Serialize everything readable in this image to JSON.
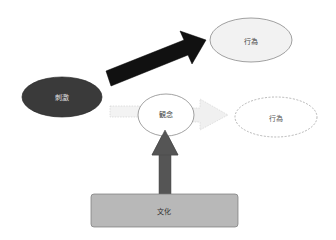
{
  "diagram": {
    "nodes": {
      "stimulus": {
        "label": "刺激",
        "fill": "#3a3a3a",
        "text_color": "#e6e6e6"
      },
      "action_top": {
        "label": "行為",
        "fill": "#f2f2f2",
        "text_color": "#444444"
      },
      "idea": {
        "label": "観念",
        "fill": "#ffffff",
        "text_color": "#444444"
      },
      "action_dashed": {
        "label": "行為",
        "fill": "#ffffff",
        "text_color": "#555555"
      },
      "culture": {
        "label": "文化",
        "fill": "#b8b8b8",
        "text_color": "#333333"
      }
    },
    "edges": [
      {
        "from": "stimulus",
        "to": "action_top",
        "style": "solid-black-arrow"
      },
      {
        "from": "stimulus",
        "to": "idea",
        "style": "dashed-light-arrow"
      },
      {
        "from": "idea",
        "to": "action_dashed",
        "style": "dashed-light-arrow"
      },
      {
        "from": "culture",
        "to": "idea",
        "style": "solid-gray-arrow"
      }
    ]
  }
}
